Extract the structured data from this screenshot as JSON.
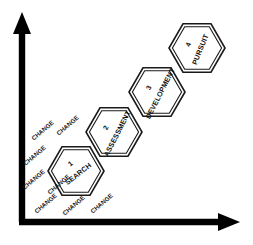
{
  "diagram": {
    "background_color": "#ffffff",
    "axis_color": "#000000",
    "shape_stroke_color": "#1a1a1a",
    "shape_fill_color": "#ffffff",
    "axes": {
      "vertical": {
        "name": "vertical-axis-arrow",
        "x": 22,
        "y_top": 14,
        "y_bottom": 222,
        "thickness": 6,
        "arrowhead": "up"
      },
      "horizontal": {
        "name": "horizontal-axis-arrow",
        "y": 222,
        "x_left": 22,
        "x_right": 240,
        "thickness": 6,
        "arrowhead": "right"
      }
    },
    "hexagons": [
      {
        "number": "1",
        "label": "SEARCH",
        "cx": 76,
        "cy": 171,
        "radius": 28,
        "label_rotation": -38
      },
      {
        "number": "2",
        "label": "ASSESSMENT",
        "cx": 114,
        "cy": 132,
        "radius": 28,
        "label_rotation": -63
      },
      {
        "number": "3",
        "label": "DEVELOPMENT",
        "cx": 157,
        "cy": 92,
        "radius": 28,
        "label_rotation": -63
      },
      {
        "number": "4",
        "label": "PURSUIT",
        "cx": 197,
        "cy": 48,
        "radius": 28,
        "label_rotation": -68
      }
    ],
    "change_labels": [
      {
        "text": "CHANGE",
        "x": 44,
        "y": 132,
        "rotation": -40
      },
      {
        "text": "CHANGE",
        "x": 69,
        "y": 127,
        "rotation": -40
      },
      {
        "text": "CHANGE",
        "x": 36,
        "y": 157,
        "rotation": -40
      },
      {
        "text": "CHANGE",
        "x": 35,
        "y": 181,
        "rotation": -40
      },
      {
        "text": "CHANGE",
        "x": 60,
        "y": 186,
        "rotation": -40
      },
      {
        "text": "CHANGE",
        "x": 47,
        "y": 205,
        "rotation": -40
      },
      {
        "text": "CHANGE",
        "x": 75,
        "y": 207,
        "rotation": -40
      },
      {
        "text": "CHANGE",
        "x": 103,
        "y": 205,
        "rotation": -40
      }
    ]
  }
}
